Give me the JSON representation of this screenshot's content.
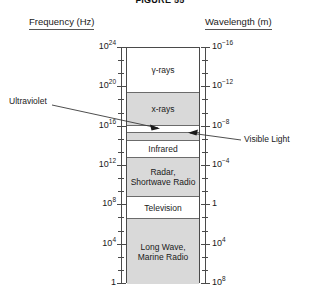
{
  "figure": {
    "title": "FIGURE 55"
  },
  "axes": {
    "left": {
      "header": "Frequency (Hz)",
      "ticks": [
        {
          "mantissa": "10",
          "exponent": "24"
        },
        {
          "mantissa": "10",
          "exponent": "20"
        },
        {
          "mantissa": "10",
          "exponent": "16"
        },
        {
          "mantissa": "10",
          "exponent": "12"
        },
        {
          "mantissa": "10",
          "exponent": "8"
        },
        {
          "mantissa": "10",
          "exponent": "4"
        },
        {
          "mantissa": "1",
          "exponent": ""
        }
      ]
    },
    "right": {
      "header": "Wavelength (m)",
      "ticks": [
        {
          "mantissa": "10",
          "exponent": "−16"
        },
        {
          "mantissa": "10",
          "exponent": "−12"
        },
        {
          "mantissa": "10",
          "exponent": "−8"
        },
        {
          "mantissa": "10",
          "exponent": "−4"
        },
        {
          "mantissa": "1",
          "exponent": ""
        },
        {
          "mantissa": "10",
          "exponent": "4"
        },
        {
          "mantissa": "10",
          "exponent": "8"
        }
      ]
    }
  },
  "bands": [
    {
      "name": "gamma-rays",
      "line1": "γ-rays",
      "line2": "",
      "shaded": false
    },
    {
      "name": "x-rays",
      "line1": "x-rays",
      "line2": "",
      "shaded": true
    },
    {
      "name": "ultraviolet",
      "line1": "",
      "line2": "",
      "shaded": false
    },
    {
      "name": "visible-light",
      "line1": "",
      "line2": "",
      "shaded": true
    },
    {
      "name": "infrared",
      "line1": "Infrared",
      "line2": "",
      "shaded": false
    },
    {
      "name": "radar-shortwave-radio",
      "line1": "Radar,",
      "line2": "Shortwave Radio",
      "shaded": true
    },
    {
      "name": "television",
      "line1": "Television",
      "line2": "",
      "shaded": false
    },
    {
      "name": "long-wave-marine-radio",
      "line1": "Long Wave,",
      "line2": "Marine Radio",
      "shaded": true
    }
  ],
  "callouts": {
    "ultraviolet": "Ultraviolet",
    "visible_light": "Visible Light"
  },
  "chart_data": {
    "type": "table",
    "title": "FIGURE 55",
    "xlabel": "",
    "ylabel": "Electromagnetic spectrum",
    "left_axis_label": "Frequency (Hz)",
    "right_axis_label": "Wavelength (m)",
    "left_axis_ticks": [
      "10^24",
      "10^20",
      "10^16",
      "10^12",
      "10^8",
      "10^4",
      "1"
    ],
    "right_axis_ticks": [
      "10^-16",
      "10^-12",
      "10^-8",
      "10^-4",
      "1",
      "10^4",
      "10^8"
    ],
    "left_axis_range": [
      "1",
      "10^24"
    ],
    "right_axis_range": [
      "10^-16",
      "10^8"
    ],
    "axis_direction": "frequency decreasing downward; wavelength increasing downward",
    "grid": false,
    "legend": "none",
    "categories": [
      "γ-rays",
      "x-rays",
      "Ultraviolet",
      "Visible Light",
      "Infrared",
      "Radar, Shortwave Radio",
      "Television",
      "Long Wave, Marine Radio"
    ],
    "bands": [
      {
        "label": "γ-rays",
        "shaded": false,
        "freq_top_hz": "10^24",
        "freq_bottom_hz": "10^20",
        "wavelength_top_m": "10^-16",
        "wavelength_bottom_m": "10^-12"
      },
      {
        "label": "x-rays",
        "shaded": true,
        "freq_top_hz": "10^20",
        "freq_bottom_hz": "10^17",
        "wavelength_top_m": "10^-12",
        "wavelength_bottom_m": "10^-9"
      },
      {
        "label": "Ultraviolet",
        "shaded": false,
        "freq_top_hz": "10^17",
        "freq_bottom_hz": "10^16",
        "wavelength_top_m": "10^-9",
        "wavelength_bottom_m": "10^-8"
      },
      {
        "label": "Visible Light",
        "shaded": true,
        "freq_top_hz": "10^16",
        "freq_bottom_hz": "10^15",
        "wavelength_top_m": "10^-8",
        "wavelength_bottom_m": "10^-7"
      },
      {
        "label": "Infrared",
        "shaded": false,
        "freq_top_hz": "10^15",
        "freq_bottom_hz": "10^13",
        "wavelength_top_m": "10^-7",
        "wavelength_bottom_m": "10^-5"
      },
      {
        "label": "Radar, Shortwave Radio",
        "shaded": true,
        "freq_top_hz": "10^13",
        "freq_bottom_hz": "10^9",
        "wavelength_top_m": "10^-5",
        "wavelength_bottom_m": "10^-1"
      },
      {
        "label": "Television",
        "shaded": false,
        "freq_top_hz": "10^9",
        "freq_bottom_hz": "10^7",
        "wavelength_top_m": "10^-1",
        "wavelength_bottom_m": "10^1"
      },
      {
        "label": "Long Wave, Marine Radio",
        "shaded": true,
        "freq_top_hz": "10^7",
        "freq_bottom_hz": "1",
        "wavelength_top_m": "10^1",
        "wavelength_bottom_m": "10^8"
      }
    ],
    "annotations": [
      {
        "text": "Ultraviolet",
        "points_to": "Ultraviolet band",
        "side": "left"
      },
      {
        "text": "Visible Light",
        "points_to": "Visible Light band",
        "side": "right"
      }
    ]
  }
}
